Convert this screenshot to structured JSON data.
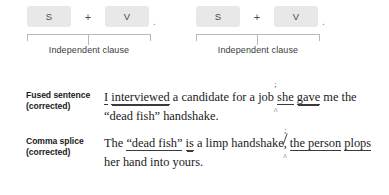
{
  "diagram": {
    "clauses": [
      {
        "subject_token": "S",
        "operator": "+",
        "verb_token": "V",
        "terminator": ".",
        "bracket_label": "Independent clause"
      },
      {
        "subject_token": "S",
        "operator": "+",
        "verb_token": "V",
        "terminator": ".",
        "bracket_label": "Independent clause"
      }
    ]
  },
  "examples": [
    {
      "label": "Fused sentence (corrected)",
      "segments": {
        "s1_subject": "I",
        "s1_verb": "interviewed",
        "s1_mid": " a candidate for a job",
        "s1_insert_mark": ";",
        "s2_subject": "she",
        "s2_verb": "gave",
        "s1_tail": " me the “dead fish” handshake."
      }
    },
    {
      "label": "Comma splice (corrected)",
      "segments": {
        "lead": "The ",
        "s1_subject": "“dead fish”",
        "s1_verb": "is",
        "s1_mid": " a limp handshake",
        "comma_deleted": ",",
        "s1_insert_mark": ";",
        "after_mark": " ",
        "s2_subject_a": "the person",
        "s2_subject_b": "plops",
        "s2_tail": " her hand into yours."
      }
    }
  ],
  "colors": {
    "token_box_bg": "#e8e8e8",
    "token_text": "#4a4a4a",
    "bracket_line": "#b9b9b9",
    "body_text": "#1a1a1a",
    "mark_ink": "#4a4a4a",
    "page_bg": "#ffffff"
  }
}
